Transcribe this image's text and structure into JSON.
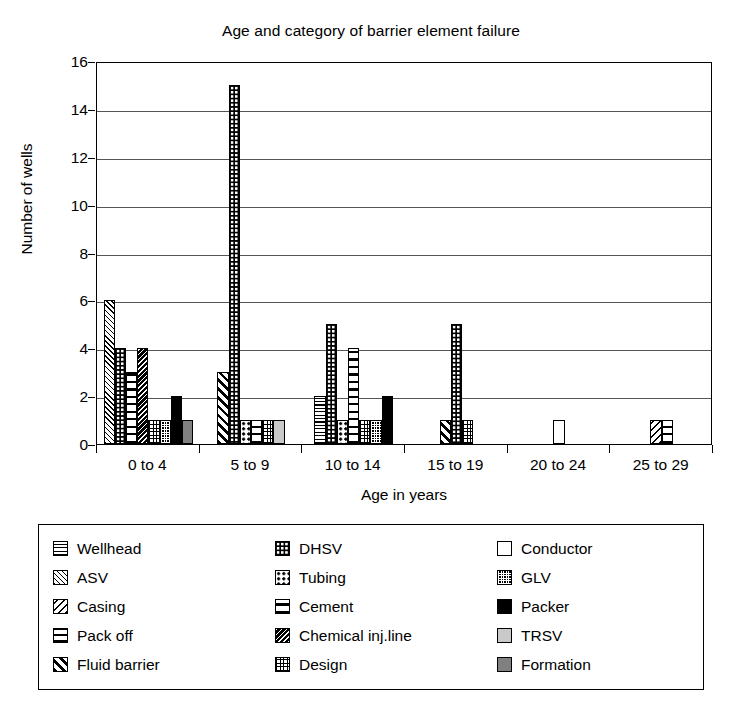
{
  "chart_data": {
    "type": "bar",
    "title": "Age and category of barrier element failure",
    "xlabel": "Age in years",
    "ylabel": "Number of wells",
    "ylim": [
      0,
      16
    ],
    "ytick_step": 2,
    "yticks": [
      "0",
      "2",
      "4",
      "6",
      "8",
      "10",
      "12",
      "14",
      "16"
    ],
    "grid": true,
    "legend_position": "below-plot",
    "categories": [
      "0 to 4",
      "5 to 9",
      "10 to 14",
      "15 to 19",
      "20 to 24",
      "25 to 29"
    ],
    "series": [
      {
        "name": "Wellhead",
        "pattern": "p-wellhead",
        "values": [
          0,
          0,
          2,
          0,
          0,
          0
        ]
      },
      {
        "name": "ASV",
        "pattern": "p-asv",
        "values": [
          6,
          0,
          0,
          0,
          0,
          0
        ]
      },
      {
        "name": "Casing",
        "pattern": "p-casing",
        "values": [
          0,
          0,
          0,
          0,
          0,
          1
        ]
      },
      {
        "name": "Pack off",
        "pattern": "p-packoff",
        "values": [
          0,
          0,
          0,
          0,
          0,
          0
        ]
      },
      {
        "name": "Fluid barrier",
        "pattern": "p-fluid",
        "values": [
          0,
          3,
          0,
          1,
          0,
          0
        ]
      },
      {
        "name": "DHSV",
        "pattern": "p-dhsv",
        "values": [
          4,
          15,
          5,
          5,
          0,
          0
        ]
      },
      {
        "name": "Tubing",
        "pattern": "p-tubing",
        "values": [
          0,
          1,
          1,
          0,
          0,
          0
        ]
      },
      {
        "name": "Cement",
        "pattern": "p-cement",
        "values": [
          3,
          1,
          4,
          0,
          0,
          1
        ]
      },
      {
        "name": "Chemical inj.line",
        "pattern": "p-chem",
        "values": [
          4,
          0,
          0,
          0,
          0,
          0
        ]
      },
      {
        "name": "Design",
        "pattern": "p-design",
        "values": [
          1,
          1,
          1,
          1,
          0,
          0
        ]
      },
      {
        "name": "Conductor",
        "pattern": "p-conductor",
        "values": [
          0,
          0,
          0,
          0,
          1,
          0
        ]
      },
      {
        "name": "GLV",
        "pattern": "p-glv",
        "values": [
          1,
          0,
          1,
          0,
          0,
          0
        ]
      },
      {
        "name": "Packer",
        "pattern": "p-packer",
        "values": [
          2,
          0,
          2,
          0,
          0,
          0
        ]
      },
      {
        "name": "TRSV",
        "pattern": "p-trsv",
        "values": [
          0,
          1,
          0,
          0,
          0,
          0
        ]
      },
      {
        "name": "Formation",
        "pattern": "p-formation",
        "values": [
          1,
          0,
          0,
          0,
          0,
          0
        ]
      }
    ]
  },
  "legend": {
    "columns": [
      [
        {
          "label": "Wellhead",
          "pattern": "p-wellhead"
        },
        {
          "label": "ASV",
          "pattern": "p-asv"
        },
        {
          "label": "Casing",
          "pattern": "p-casing"
        },
        {
          "label": "Pack off",
          "pattern": "p-packoff"
        },
        {
          "label": "Fluid barrier",
          "pattern": "p-fluid"
        }
      ],
      [
        {
          "label": "DHSV",
          "pattern": "p-dhsv"
        },
        {
          "label": "Tubing",
          "pattern": "p-tubing"
        },
        {
          "label": "Cement",
          "pattern": "p-cement"
        },
        {
          "label": "Chemical inj.line",
          "pattern": "p-chem"
        },
        {
          "label": "Design",
          "pattern": "p-design"
        }
      ],
      [
        {
          "label": "Conductor",
          "pattern": "p-conductor"
        },
        {
          "label": "GLV",
          "pattern": "p-glv"
        },
        {
          "label": "Packer",
          "pattern": "p-packer"
        },
        {
          "label": "TRSV",
          "pattern": "p-trsv"
        },
        {
          "label": "Formation",
          "pattern": "p-formation"
        }
      ]
    ]
  }
}
